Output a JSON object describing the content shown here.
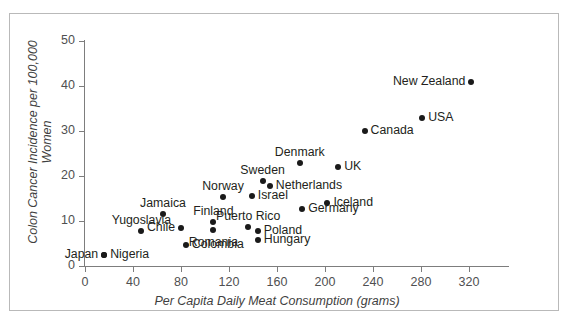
{
  "chart_data": {
    "type": "scatter",
    "title": "",
    "xlabel": "Per Capita Daily Meat Consumption (grams)",
    "ylabel": "Colon Cancer Incidence per 100,000 Women",
    "xlim": [
      0,
      320
    ],
    "ylim": [
      0,
      50
    ],
    "xticks": [
      0,
      40,
      80,
      120,
      160,
      200,
      240,
      280,
      320
    ],
    "yticks": [
      0,
      10,
      20,
      30,
      40,
      50
    ],
    "grid": false,
    "legend": "none",
    "marker_color": "#1a1a1a",
    "axis_color": "#7d7d7d",
    "points": [
      {
        "label": "Japan",
        "x": 16,
        "y": 2.5,
        "label_pos": "left"
      },
      {
        "label": "Nigeria",
        "x": 16,
        "y": 2.5,
        "label_pos": "right"
      },
      {
        "label": "Yugoslavia",
        "x": 47,
        "y": 7.8,
        "label_pos": "above"
      },
      {
        "label": "Jamaica",
        "x": 65,
        "y": 11.5,
        "label_pos": "above"
      },
      {
        "label": "Chile",
        "x": 80,
        "y": 8.5,
        "label_pos": "left"
      },
      {
        "label": "Colombia",
        "x": 84,
        "y": 4.7,
        "label_pos": "right"
      },
      {
        "label": "Finland",
        "x": 107,
        "y": 9.8,
        "label_pos": "above"
      },
      {
        "label": "Romania",
        "x": 107,
        "y": 8.0,
        "label_pos": "below"
      },
      {
        "label": "Norway",
        "x": 115,
        "y": 15.3,
        "label_pos": "above"
      },
      {
        "label": "Israel",
        "x": 139,
        "y": 15.5,
        "label_pos": "right"
      },
      {
        "label": "Sweden",
        "x": 148,
        "y": 19.0,
        "label_pos": "above"
      },
      {
        "label": "Netherlands",
        "x": 154,
        "y": 17.8,
        "label_pos": "right"
      },
      {
        "label": "Puerto Rico",
        "x": 136,
        "y": 8.7,
        "label_pos": "above"
      },
      {
        "label": "Poland",
        "x": 144,
        "y": 7.8,
        "label_pos": "right"
      },
      {
        "label": "Hungary",
        "x": 144,
        "y": 5.8,
        "label_pos": "right"
      },
      {
        "label": "Denmark",
        "x": 179,
        "y": 23.0,
        "label_pos": "above"
      },
      {
        "label": "Germany",
        "x": 181,
        "y": 12.7,
        "label_pos": "right"
      },
      {
        "label": "UK",
        "x": 211,
        "y": 22.0,
        "label_pos": "right"
      },
      {
        "label": "Iceland",
        "x": 202,
        "y": 14.0,
        "label_pos": "right"
      },
      {
        "label": "Canada",
        "x": 233,
        "y": 30.0,
        "label_pos": "right"
      },
      {
        "label": "USA",
        "x": 281,
        "y": 33.0,
        "label_pos": "right"
      },
      {
        "label": "New Zealand",
        "x": 322,
        "y": 41.0,
        "label_pos": "left"
      }
    ]
  }
}
